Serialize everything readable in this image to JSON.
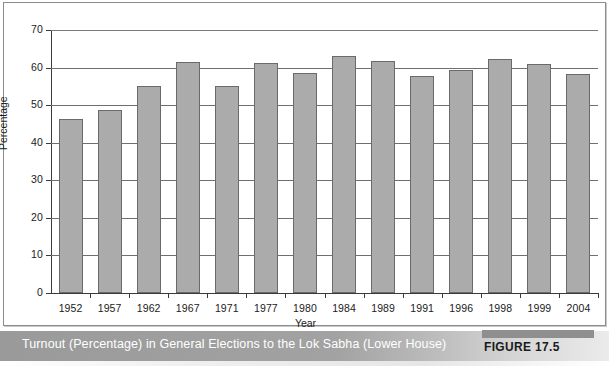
{
  "figure": {
    "caption": "Turnout (Percentage) in General Elections to the Lok Sabha (Lower House)",
    "tag": "FIGURE 17.5"
  },
  "colors": {
    "bar_fill": "#ababab",
    "bar_stroke": "#6a6a6a",
    "gridline": "#6f6f6f",
    "axis": "#3a3a3a",
    "caption_bar": "#9a9a9a",
    "caption_text": "#ffffff"
  },
  "chart_data": {
    "type": "bar",
    "title": "",
    "xlabel": "Year",
    "ylabel": "Percentage",
    "ylim": [
      0,
      70
    ],
    "yticks": [
      0,
      10,
      20,
      30,
      40,
      50,
      60,
      70
    ],
    "grid": true,
    "legend": null,
    "categories": [
      "1952",
      "1957",
      "1962",
      "1967",
      "1971",
      "1977",
      "1980",
      "1984",
      "1989",
      "1991",
      "1996",
      "1998",
      "1999",
      "2004"
    ],
    "values": [
      46.3,
      48.6,
      55.1,
      61.5,
      55.2,
      61.3,
      58.5,
      63.2,
      61.7,
      57.7,
      59.4,
      62.3,
      61.0,
      58.3
    ]
  }
}
